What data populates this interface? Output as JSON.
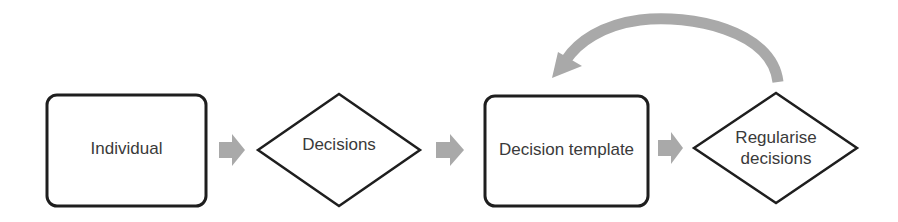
{
  "diagram": {
    "colors": {
      "stroke": "#1e1e1e",
      "arrow_fill": "#a9a9a9",
      "text": "#3a3a3a",
      "background": "#ffffff"
    },
    "nodes": [
      {
        "id": "individual",
        "shape": "rounded-rectangle",
        "label": "Individual"
      },
      {
        "id": "decisions",
        "shape": "diamond",
        "label": "Decisions"
      },
      {
        "id": "decision-template",
        "shape": "rounded-rectangle",
        "label": "Decision template"
      },
      {
        "id": "regularise-decisions",
        "shape": "diamond",
        "label": "Regularise\ndecisions"
      }
    ],
    "edges": [
      {
        "from": "individual",
        "to": "decisions",
        "style": "block-arrow"
      },
      {
        "from": "decisions",
        "to": "decision-template",
        "style": "block-arrow"
      },
      {
        "from": "decision-template",
        "to": "regularise-decisions",
        "style": "block-arrow"
      },
      {
        "from": "regularise-decisions",
        "to": "decision-template",
        "style": "curved-feedback-arrow"
      }
    ]
  }
}
